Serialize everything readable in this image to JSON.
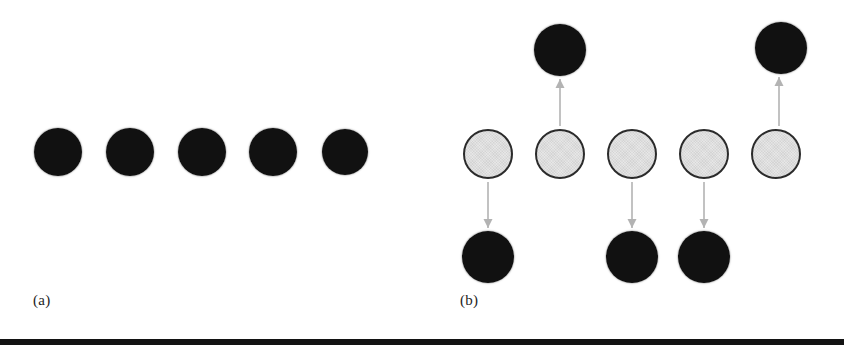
{
  "figure": {
    "width": 844,
    "height": 351,
    "background": "#ffffff",
    "rule": {
      "color": "#131313",
      "y": 339,
      "height": 6
    }
  },
  "colors": {
    "filled_node": "#111111",
    "open_node_fill": "#e4e4e4",
    "open_node_stroke": "#2b2b2b",
    "arrow": "#b3b3b3",
    "label_text": "#1d1d1d"
  },
  "panels": [
    {
      "id": "a",
      "label": "(a)",
      "label_x": 33,
      "label_y": 292,
      "nodes": [
        {
          "name": "node-a-1",
          "state": "filled",
          "cx": 58,
          "cy": 152,
          "r": 24
        },
        {
          "name": "node-a-2",
          "state": "filled",
          "cx": 130,
          "cy": 152,
          "r": 24
        },
        {
          "name": "node-a-3",
          "state": "filled",
          "cx": 202,
          "cy": 152,
          "r": 24
        },
        {
          "name": "node-a-4",
          "state": "filled",
          "cx": 273,
          "cy": 152,
          "r": 24
        },
        {
          "name": "node-a-5",
          "state": "filled",
          "cx": 345,
          "cy": 152,
          "r": 23
        }
      ],
      "arrows": []
    },
    {
      "id": "b",
      "label": "(b)",
      "label_x": 460,
      "label_y": 292,
      "nodes": [
        {
          "name": "node-b-open-1",
          "state": "open",
          "cx": 488,
          "cy": 154,
          "r": 25
        },
        {
          "name": "node-b-open-2",
          "state": "open",
          "cx": 560,
          "cy": 154,
          "r": 25
        },
        {
          "name": "node-b-open-3",
          "state": "open",
          "cx": 632,
          "cy": 154,
          "r": 25
        },
        {
          "name": "node-b-open-4",
          "state": "open",
          "cx": 704,
          "cy": 154,
          "r": 25
        },
        {
          "name": "node-b-open-5",
          "state": "open",
          "cx": 776,
          "cy": 154,
          "r": 25
        },
        {
          "name": "node-b-up-2",
          "state": "filled",
          "cx": 560,
          "cy": 50,
          "r": 26
        },
        {
          "name": "node-b-up-5",
          "state": "filled",
          "cx": 781,
          "cy": 48,
          "r": 26
        },
        {
          "name": "node-b-down-1",
          "state": "filled",
          "cx": 488,
          "cy": 257,
          "r": 26
        },
        {
          "name": "node-b-down-3",
          "state": "filled",
          "cx": 632,
          "cy": 257,
          "r": 26
        },
        {
          "name": "node-b-down-4",
          "state": "filled",
          "cx": 704,
          "cy": 257,
          "r": 26
        }
      ],
      "arrows": [
        {
          "name": "arrow-down-col-1",
          "direction": "down",
          "x": 488,
          "y1": 182,
          "y2": 228
        },
        {
          "name": "arrow-up-col-2",
          "direction": "up",
          "x": 560,
          "y1": 126,
          "y2": 79
        },
        {
          "name": "arrow-down-col-3",
          "direction": "down",
          "x": 632,
          "y1": 182,
          "y2": 228
        },
        {
          "name": "arrow-down-col-4",
          "direction": "down",
          "x": 704,
          "y1": 182,
          "y2": 228
        },
        {
          "name": "arrow-up-col-5",
          "direction": "up",
          "x": 779,
          "y1": 126,
          "y2": 77
        }
      ]
    }
  ],
  "chart_data": {
    "type": "diagram",
    "title": "",
    "panels": [
      {
        "id": "a",
        "label": "(a)",
        "row_count": 5,
        "states": [
          "filled",
          "filled",
          "filled",
          "filled",
          "filled"
        ],
        "displacements": [
          0,
          0,
          0,
          0,
          0
        ]
      },
      {
        "id": "b",
        "label": "(b)",
        "row_count": 5,
        "states": [
          "open",
          "open",
          "open",
          "open",
          "open"
        ],
        "displacements": [
          -1,
          1,
          -1,
          -1,
          1
        ],
        "displacement_legend": {
          "1": "up",
          "-1": "down",
          "0": "none"
        },
        "arrow_count": 5
      }
    ]
  }
}
